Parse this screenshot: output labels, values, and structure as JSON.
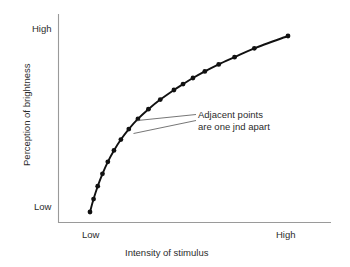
{
  "chart_data": {
    "type": "line",
    "title": "",
    "subtitle": "",
    "xlabel": "Intensity of stimulus",
    "ylabel": "Perception of brightness",
    "xticklabels": [
      "Low",
      "High"
    ],
    "yticklabels": [
      "Low",
      "High"
    ],
    "xlim": [
      0,
      1
    ],
    "ylim": [
      0,
      1
    ],
    "grid": false,
    "legend": null,
    "legend_position": "none",
    "series": [
      {
        "name": "Perceived brightness vs stimulus intensity",
        "marker": "filled-circle",
        "color": "#111111",
        "x": [
          0.0,
          0.018,
          0.039,
          0.063,
          0.09,
          0.121,
          0.156,
          0.196,
          0.242,
          0.295,
          0.355,
          0.424,
          0.47,
          0.52,
          0.58,
          0.65,
          0.73,
          0.83,
          1.0
        ],
        "y": [
          0.0,
          0.07,
          0.14,
          0.207,
          0.272,
          0.334,
          0.393,
          0.45,
          0.505,
          0.558,
          0.61,
          0.662,
          0.694,
          0.727,
          0.763,
          0.801,
          0.84,
          0.888,
          0.955
        ]
      }
    ],
    "annotations": [
      {
        "text_line_1": "Adjacent points",
        "text_line_2": "are one jnd apart",
        "points_to": [
          "point-11",
          "point-12"
        ]
      }
    ]
  },
  "axes": {
    "y_top_label": "High",
    "y_bottom_label": "Low",
    "x_left_label": "Low",
    "x_right_label": "High",
    "y_title": "Perception of brightness",
    "x_title": "Intensity of stimulus",
    "axis_color": "#9a9a9a",
    "curve_color": "#111111"
  },
  "annotation": {
    "line1": "Adjacent points",
    "line2": "are one jnd apart"
  }
}
